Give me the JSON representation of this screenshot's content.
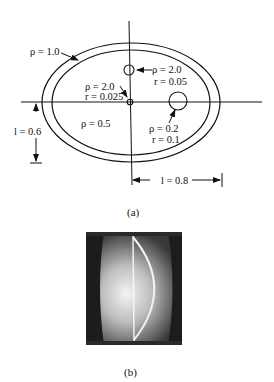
{
  "figure_a": {
    "caption": "(a)",
    "outer_label": "ρ = 1.0",
    "top_circle": {
      "rho": "ρ = 2.0",
      "r": "r = 0.05"
    },
    "center_circle": {
      "rho": "ρ = 2.0",
      "r": "r = 0.025"
    },
    "right_circle": {
      "rho": "ρ = 0.2",
      "r": "r = 0.1"
    },
    "interior_label": "ρ = 0.5",
    "vertical_dimension": "l = 0.6",
    "horizontal_dimension": "l = 0.8"
  },
  "figure_b": {
    "caption": "(b)"
  }
}
